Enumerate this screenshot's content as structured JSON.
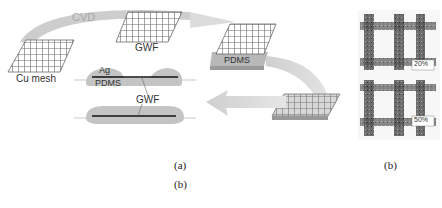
{
  "figure": {
    "schematic": {
      "labels": {
        "cvd": "CVD",
        "cu_mesh": "Cu mesh",
        "gwf_top": "GWF",
        "pdms_substrate": "PDMS",
        "ag": "Ag",
        "pdms_cross_section": "PDMS",
        "gwf_cross_section": "GWF"
      },
      "caption": "(a)"
    },
    "micrograph": {
      "strain_labels": [
        "20%",
        "50%"
      ],
      "caption": "(b)"
    },
    "secondary_caption": "(b)",
    "colors": {
      "arrow": "#c8c8c8",
      "mesh_line": "#6a6a6a",
      "pdms": "#b4b4b4",
      "gwf_line": "#111111",
      "text": "#333333"
    }
  }
}
